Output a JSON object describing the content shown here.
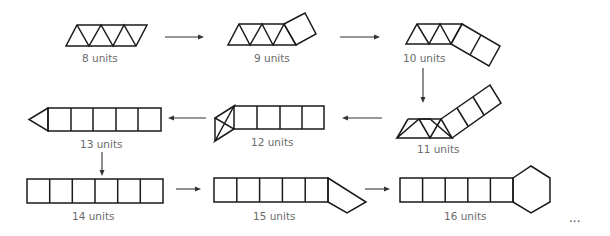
{
  "figures": [
    {
      "id": "fig-8",
      "label": "8 units",
      "perimeter": 8,
      "composition": [
        "triangle",
        "triangle",
        "triangle",
        "triangle",
        "triangle"
      ]
    },
    {
      "id": "fig-9",
      "label": "9 units",
      "perimeter": 9,
      "composition": [
        "triangle",
        "triangle",
        "triangle",
        "triangle",
        "triangle",
        "square"
      ]
    },
    {
      "id": "fig-10",
      "label": "10 units",
      "perimeter": 10,
      "composition": [
        "triangle",
        "triangle",
        "triangle",
        "triangle",
        "square",
        "square"
      ]
    },
    {
      "id": "fig-11",
      "label": "11 units",
      "perimeter": 11,
      "composition": [
        "triangle",
        "triangle",
        "triangle",
        "square",
        "square",
        "square"
      ]
    },
    {
      "id": "fig-12",
      "label": "12 units",
      "perimeter": 12,
      "composition": [
        "triangle",
        "triangle",
        "square",
        "square",
        "square",
        "square"
      ]
    },
    {
      "id": "fig-13",
      "label": "13 units",
      "perimeter": 13,
      "composition": [
        "triangle",
        "square",
        "square",
        "square",
        "square",
        "square"
      ]
    },
    {
      "id": "fig-14",
      "label": "14 units",
      "perimeter": 14,
      "composition": [
        "square",
        "square",
        "square",
        "square",
        "square",
        "square"
      ]
    },
    {
      "id": "fig-15",
      "label": "15 units",
      "perimeter": 15,
      "composition": [
        "square",
        "square",
        "square",
        "square",
        "square",
        "pentagon"
      ]
    },
    {
      "id": "fig-16",
      "label": "16 units",
      "perimeter": 16,
      "composition": [
        "square",
        "square",
        "square",
        "square",
        "square",
        "hexagon"
      ]
    }
  ],
  "continuation": "..."
}
